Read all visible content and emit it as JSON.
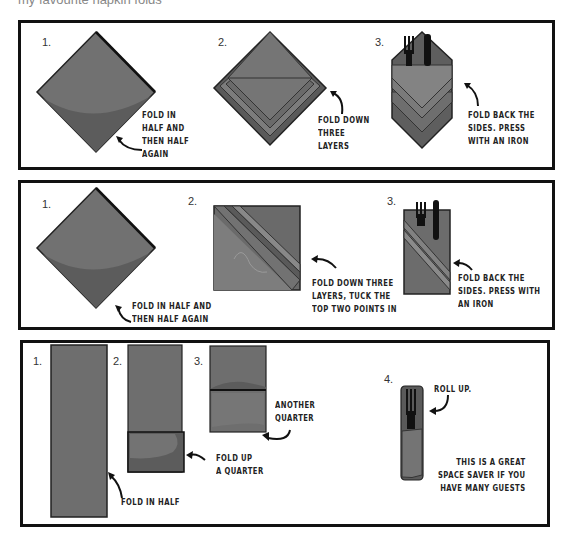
{
  "header": {
    "caption": "my favourite napkin folds"
  },
  "colors": {
    "napkin": "#6e6e6e",
    "napkin_shade": "#5a5a5a",
    "napkin_light": "#858585",
    "border": "#111111",
    "text": "#222222"
  },
  "panels": [
    {
      "steps": [
        {
          "number": "1.",
          "note": [
            "Fold in",
            "half and",
            "then half",
            "again"
          ],
          "icon": "diamond-napkin"
        },
        {
          "number": "2.",
          "note": [
            "Fold down",
            "three",
            "layers"
          ],
          "icon": "layered-diamond-napkin"
        },
        {
          "number": "3.",
          "note": [
            "Fold back the",
            "sides. Press",
            "with an iron"
          ],
          "icon": "pocket-napkin-with-cutlery"
        }
      ]
    },
    {
      "steps": [
        {
          "number": "1.",
          "note": [
            "Fold in half and",
            "then half again"
          ],
          "icon": "diamond-napkin"
        },
        {
          "number": "2.",
          "note": [
            "Fold down three",
            "layers, tuck the",
            "top two points in"
          ],
          "icon": "square-diagonal-layers-napkin"
        },
        {
          "number": "3.",
          "note": [
            "Fold back the",
            "sides. Press with",
            "an iron"
          ],
          "icon": "rectangular-pocket-with-cutlery"
        }
      ]
    },
    {
      "steps": [
        {
          "number": "1.",
          "note": [
            "Fold in half"
          ],
          "icon": "tall-rectangle-napkin"
        },
        {
          "number": "2.",
          "note": [
            "Fold up",
            "a quarter"
          ],
          "icon": "folded-up-quarter-napkin"
        },
        {
          "number": "3.",
          "note": [
            "Another",
            "quarter"
          ],
          "icon": "folded-another-quarter-napkin"
        },
        {
          "number": "4.",
          "note": [
            "Roll up."
          ],
          "icon": "rolled-napkin-with-fork"
        }
      ],
      "tip": [
        "This is a great",
        "space saver if you",
        "have many guests"
      ]
    }
  ]
}
